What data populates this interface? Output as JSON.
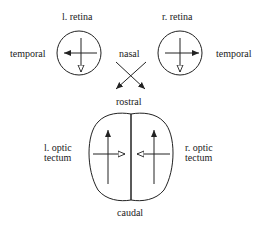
{
  "labels": {
    "l_retina": "l. retina",
    "r_retina": "r. retina",
    "temporal_left": "temporal",
    "temporal_right": "temporal",
    "nasal": "nasal",
    "rostral": "rostral",
    "caudal": "caudal",
    "l_tectum_1": "l. optic",
    "l_tectum_2": "tectum",
    "r_tectum_1": "r. optic",
    "r_tectum_2": "tectum"
  }
}
